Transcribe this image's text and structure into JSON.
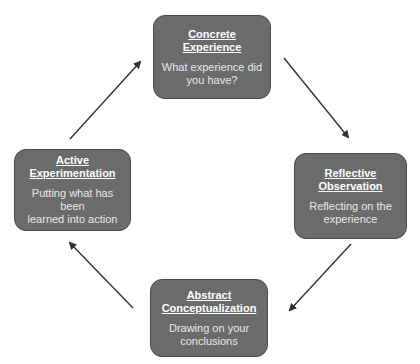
{
  "diagram": {
    "type": "cycle",
    "colors": {
      "box_fill": "#6b6b6b",
      "box_text": "#ffffff",
      "arrow": "#333333",
      "background": "#ffffff"
    },
    "stages": [
      {
        "id": "concrete",
        "title_line1": "Concrete",
        "title_line2": "Experience",
        "desc_line1": "What experience did",
        "desc_line2": "you have?"
      },
      {
        "id": "reflective",
        "title_line1": "Reflective",
        "title_line2": "Observation",
        "desc_line1": "Reflecting on the",
        "desc_line2": "experience"
      },
      {
        "id": "abstract",
        "title_line1": "Abstract",
        "title_line2": "Conceptualization",
        "desc_line1": "Drawing on your",
        "desc_line2": "conclusions"
      },
      {
        "id": "active",
        "title_line1": "Active",
        "title_line2": "Experimentation",
        "desc_line1": "Putting what has been",
        "desc_line2": "learned into action"
      }
    ],
    "arrows": [
      {
        "from": "concrete",
        "to": "reflective"
      },
      {
        "from": "reflective",
        "to": "abstract"
      },
      {
        "from": "abstract",
        "to": "active"
      },
      {
        "from": "active",
        "to": "concrete"
      }
    ]
  }
}
